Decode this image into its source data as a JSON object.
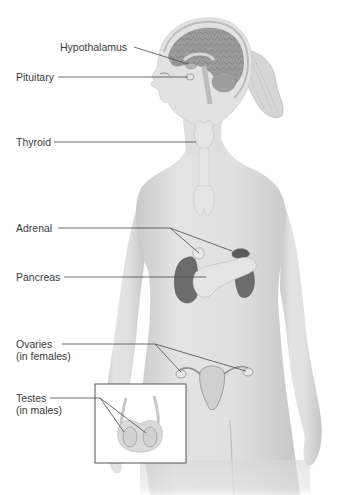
{
  "diagram": {
    "labels": {
      "hypothalamus": "Hypothalamus",
      "pituitary": "Pituitary",
      "thyroid": "Thyroid",
      "adrenal": "Adrenal",
      "pancreas": "Pancreas",
      "ovaries": "Ovaries",
      "ovaries_note": "(in females)",
      "testes": "Testes",
      "testes_note": "(in males)"
    },
    "colors": {
      "background": "#ffffff",
      "skin": "#dcdcdc",
      "skin_shadow": "#c4c4c4",
      "brain": "#9a9a9a",
      "gland_light": "#e6e6e6",
      "kidney": "#6e6e6e",
      "leader_line": "#4a4a4a",
      "label_text": "#3a3a3a",
      "inset_border": "#555555"
    }
  }
}
